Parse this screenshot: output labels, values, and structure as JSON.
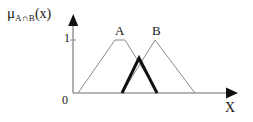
{
  "figure": {
    "background_color": "#ffffff",
    "ink_color": "#161616",
    "curve_color": "#8c8c8c",
    "intersection_color": "#111111"
  },
  "labels": {
    "y_axis": {
      "mu": "μ",
      "subscript": "A∩B",
      "argument": "(x)",
      "full": "μ_{A∩B}(x)"
    },
    "y_tick_one": "1",
    "origin": "0",
    "x_axis": "X",
    "set_a": "A",
    "set_b": "B"
  },
  "chart_data": {
    "type": "line",
    "xlabel": "X",
    "ylabel": "μ_{A∩B}(x)",
    "xlim": [
      0,
      10
    ],
    "ylim": [
      0,
      1.15
    ],
    "yticks": [
      0,
      1
    ],
    "ytick_labels": [
      "0",
      "1"
    ],
    "xticks": [],
    "xtick_labels": [],
    "grid": false,
    "legend": false,
    "series": [
      {
        "name": "A",
        "label": "A",
        "color": "#8c8c8c",
        "linewidth": 1,
        "shape": "trapezoid",
        "x": [
          0.3,
          2.6,
          3.2,
          5.25
        ],
        "y": [
          0,
          1,
          1,
          0
        ]
      },
      {
        "name": "B",
        "label": "B",
        "color": "#8c8c8c",
        "linewidth": 1,
        "shape": "triangle",
        "x": [
          2.98,
          5.0,
          7.45
        ],
        "y": [
          0,
          1,
          0
        ]
      },
      {
        "name": "A∩B",
        "label": "",
        "color": "#111111",
        "linewidth": 3,
        "shape": "triangle",
        "x": [
          2.98,
          4.05,
          5.12
        ],
        "y": [
          0,
          0.62,
          0
        ]
      }
    ],
    "annotations": [
      {
        "text": "A",
        "x": 2.72,
        "y": 1.12
      },
      {
        "text": "B",
        "x": 4.97,
        "y": 1.12
      }
    ]
  },
  "geometry": {
    "axis_origin_px": [
      73,
      93
    ],
    "y_axis_top_px": 18,
    "x_axis_right_px": 237,
    "y_value_one_px": 40,
    "curve_a_points_px": "78,93 115,40 125,40 158,93",
    "curve_b_points_px": "122,93 155,40 195,93",
    "intersection_points_px": "122,93 139,58 157,93"
  }
}
